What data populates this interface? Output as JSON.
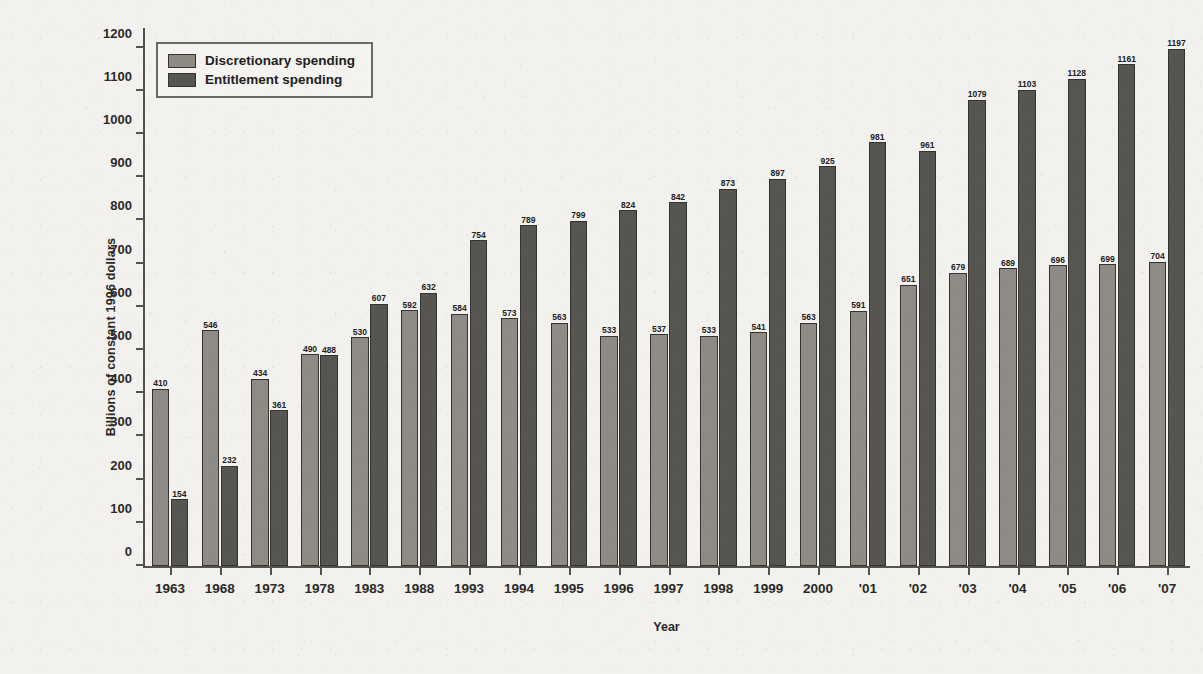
{
  "chart_data": {
    "type": "bar",
    "title": "",
    "xlabel": "Year",
    "ylabel": "Billions of constant 1996 dollars",
    "ylim": [
      0,
      1250
    ],
    "yticks": [
      0,
      100,
      200,
      300,
      400,
      500,
      600,
      700,
      800,
      900,
      1000,
      1100,
      1200
    ],
    "grid": false,
    "legend_position": "top-left",
    "categories": [
      "1963",
      "1968",
      "1973",
      "1978",
      "1983",
      "1988",
      "1993",
      "1994",
      "1995",
      "1996",
      "1997",
      "1998",
      "1999",
      "2000",
      "'01",
      "'02",
      "'03",
      "'04",
      "'05",
      "'06",
      "'07"
    ],
    "series": [
      {
        "name": "Discretionary spending",
        "color": "#8d8b84",
        "values": [
          410,
          546,
          434,
          490,
          530,
          592,
          584,
          573,
          563,
          533,
          537,
          533,
          541,
          563,
          591,
          651,
          679,
          689,
          696,
          699,
          704
        ]
      },
      {
        "name": "Entitlement spending",
        "color": "#57554f",
        "values": [
          154,
          232,
          361,
          488,
          607,
          632,
          754,
          789,
          799,
          824,
          842,
          873,
          897,
          925,
          981,
          961,
          1079,
          1103,
          1128,
          1161,
          1197
        ]
      }
    ]
  },
  "legend": {
    "items": [
      {
        "label": "Discretionary spending"
      },
      {
        "label": "Entitlement spending"
      }
    ]
  },
  "colors": {
    "discretionary": "#8d8b84",
    "entitlement": "#57554f",
    "axis": "#55534e",
    "background": "#f2f1ed",
    "text": "#2a2a28"
  }
}
